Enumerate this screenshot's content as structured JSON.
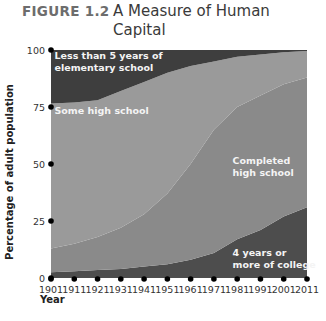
{
  "figure": {
    "label": "FIGURE 1.2",
    "title": "A Measure of Human Capital"
  },
  "chart_data": {
    "type": "area",
    "title": "A Measure of Human Capital",
    "xlabel": "Year",
    "ylabel": "Percentage of adult population",
    "x": [
      1901,
      1911,
      1921,
      1931,
      1941,
      1951,
      1961,
      1971,
      1981,
      1991,
      2001,
      2011
    ],
    "xlim": [
      1901,
      2011
    ],
    "ylim": [
      0,
      100
    ],
    "x_ticks": [
      "1901",
      "1911",
      "1921",
      "1931",
      "1941",
      "1951",
      "1961",
      "1971",
      "1981",
      "1991",
      "2001",
      "2011"
    ],
    "y_ticks": [
      "0",
      "25",
      "50",
      "75",
      "100"
    ],
    "y_tick_values": [
      0,
      25,
      50,
      75,
      100
    ],
    "stacked": true,
    "series": [
      {
        "name": "4 years or more of college",
        "label_lines": [
          "4 years or",
          "more of college"
        ],
        "color": "#4d4d4d",
        "values": [
          2.5,
          3,
          3.5,
          4,
          5,
          6,
          8,
          11,
          17,
          21,
          27,
          31
        ]
      },
      {
        "name": "Completed high school",
        "label_lines": [
          "Completed",
          "high school"
        ],
        "color": "#8a8a8a",
        "values": [
          10.5,
          12,
          14.5,
          18,
          23,
          31,
          42,
          54,
          58,
          59,
          58,
          57
        ]
      },
      {
        "name": "Some high school",
        "label_lines": [
          "Some high school"
        ],
        "color": "#9a9a9a",
        "values": [
          63.5,
          62,
          60,
          60,
          58,
          53,
          43,
          30,
          22,
          18,
          14,
          11.5
        ]
      },
      {
        "name": "Less than 5 years of elementary school",
        "label_lines": [
          "Less than 5 years of",
          "elementary school"
        ],
        "color": "#3e3e3e",
        "values": [
          23.5,
          23,
          22,
          18,
          14,
          10,
          7,
          5,
          3,
          2,
          1,
          0.5
        ]
      }
    ],
    "grid": false,
    "legend": "inline-labels"
  }
}
